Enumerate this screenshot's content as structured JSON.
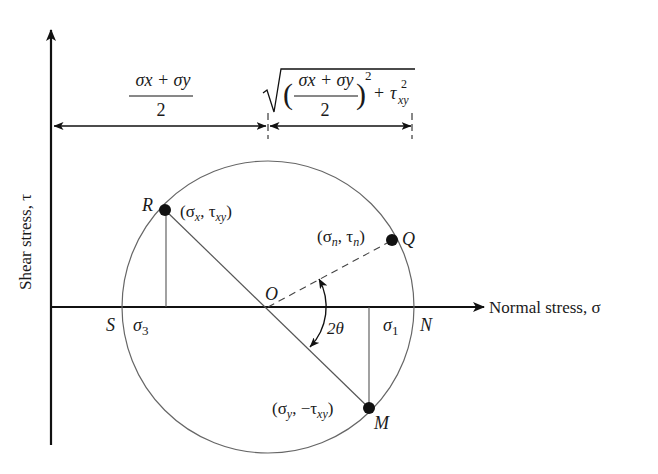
{
  "diagram": {
    "type": "mohr-circle",
    "axes": {
      "vertical": {
        "label": "Shear stress, τ"
      },
      "horizontal": {
        "label": "Normal stress, σ"
      }
    },
    "dimensions": {
      "center_distance": {
        "numerator": "σx + σy",
        "denominator": "2"
      },
      "radius": {
        "expression": "√(((σx + σy)/2)² + τxy²)",
        "numerator": "σx + σy",
        "denominator": "2",
        "power": "2",
        "tail": "+ τ",
        "tail_sub": "xy",
        "tail_sup": "2"
      }
    },
    "points": {
      "R": {
        "name": "R",
        "coords": "(σx, τxy)",
        "c_open": "(σ",
        "c_sub1": "x",
        "c_mid": ", τ",
        "c_sub2": "xy",
        "c_close": ")"
      },
      "Q": {
        "name": "Q",
        "coords": "(σn, τn)",
        "c_open": "(σ",
        "c_sub1": "n",
        "c_mid": ", τ",
        "c_sub2": "n",
        "c_close": ")"
      },
      "M": {
        "name": "M",
        "coords": "(σy, −τxy)",
        "c_open": "(σ",
        "c_sub1": "y",
        "c_mid": ", −τ",
        "c_sub2": "xy",
        "c_close": ")"
      },
      "O": {
        "name": "O"
      },
      "S": {
        "name": "S"
      },
      "N": {
        "name": "N"
      }
    },
    "principal": {
      "sigma1": {
        "base": "σ",
        "sub": "1"
      },
      "sigma3": {
        "base": "σ",
        "sub": "3"
      }
    },
    "angle": {
      "label": "2θ"
    },
    "colors": {
      "ink": "#1a1a1a",
      "circle": "#666666",
      "axis": "#111111"
    }
  }
}
